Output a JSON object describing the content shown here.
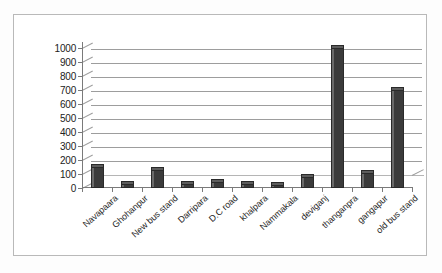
{
  "chart_data": {
    "type": "bar",
    "title": "",
    "subtitle": "",
    "xlabel": "",
    "ylabel": "",
    "categories": [
      "Navapaara",
      "Ghohanpur",
      "New bus stand",
      "Darripara",
      "D.C road",
      "khalpara",
      "Nammakala",
      "deviganj",
      "thanganpra",
      "gangapur",
      "old bus stand"
    ],
    "values": [
      150,
      30,
      130,
      30,
      45,
      30,
      25,
      80,
      1000,
      110,
      700
    ],
    "ylim": [
      0,
      1000
    ],
    "ytick_step": 100,
    "yticks": [
      0,
      100,
      200,
      300,
      400,
      500,
      600,
      700,
      800,
      900,
      1000
    ],
    "ytick_labels": [
      "0",
      "100",
      "200",
      "300",
      "400",
      "500",
      "600",
      "700",
      "800",
      "900",
      "1000"
    ],
    "grid": true,
    "grid_axis": "y",
    "legend": false,
    "legend_position": "none",
    "style": "3d-column",
    "bar_color": "#3b3b3b",
    "bar_top_color": "#5d5d5d",
    "grid_color": "#9d9d9d",
    "axis_color": "#7a7a7a",
    "plot_background": "#ffffff",
    "frame_color": "#b9b9b9"
  }
}
